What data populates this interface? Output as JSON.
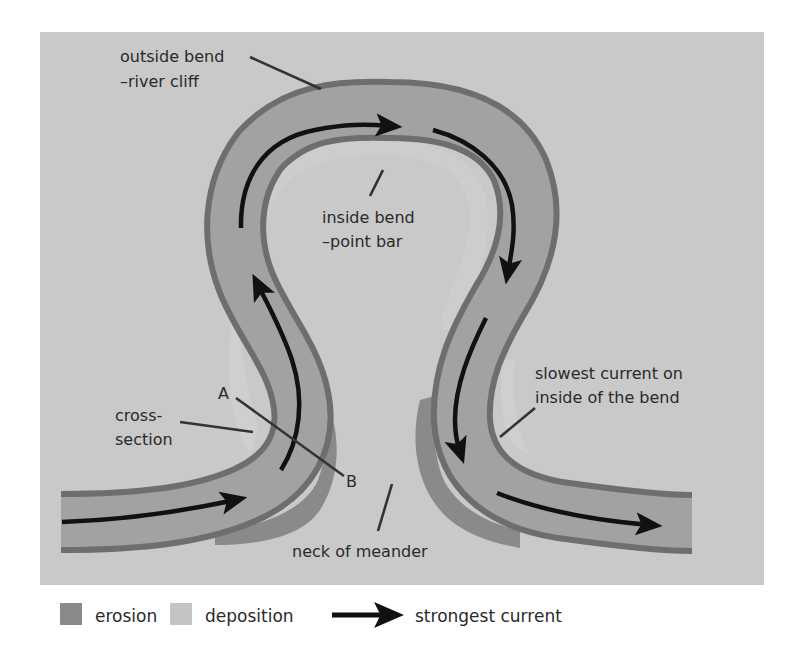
{
  "diagram": {
    "labels": {
      "outside_bend_line1": "outside bend",
      "outside_bend_line2": "–river cliff",
      "inside_bend_line1": "inside bend",
      "inside_bend_line2": "–point bar",
      "cross_section_line1": "cross-",
      "cross_section_line2": "section",
      "point_a": "A",
      "point_b": "B",
      "slowest_line1": "slowest current on",
      "slowest_line2": "inside of the bend",
      "neck": "neck of meander"
    },
    "legend": {
      "erosion": "erosion",
      "deposition": "deposition",
      "current": "strongest current"
    },
    "colors": {
      "page_bg": "#ffffff",
      "panel_bg": "#c9c9c9",
      "water": "#a2a2a2",
      "bank": "#6e6e6e",
      "erosion": "#8a8a8a",
      "deposition": "#d3d3d3",
      "arrow": "#111111",
      "text": "#2a2a2a"
    }
  }
}
